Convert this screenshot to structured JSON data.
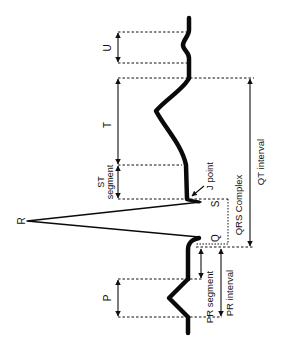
{
  "colors": {
    "trace": "#0a0a0a",
    "line": "#111111",
    "background": "#ffffff"
  },
  "waves": {
    "p": "P",
    "q": "Q",
    "r": "R",
    "s": "S",
    "t": "T",
    "u": "U"
  },
  "labels": {
    "j_point": "J point",
    "st_segment_line1": "ST",
    "st_segment_line2": "segment",
    "qrs_complex": "QRS Complex",
    "qt_interval": "QT interval",
    "pr_segment": "PR segment",
    "pr_interval": "PR interval"
  }
}
